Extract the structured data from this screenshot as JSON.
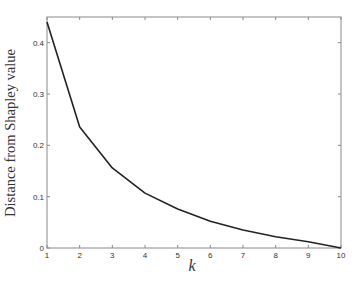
{
  "chart_data": {
    "type": "line",
    "title": "",
    "xlabel": "k",
    "ylabel": "Distance from Shapley value",
    "x": [
      1,
      2,
      3,
      4,
      5,
      6,
      7,
      8,
      9,
      10
    ],
    "series": [
      {
        "name": "distance",
        "values": [
          0.44,
          0.236,
          0.156,
          0.107,
          0.076,
          0.052,
          0.035,
          0.022,
          0.012,
          0.0
        ],
        "color": "#222222"
      }
    ],
    "xlim": [
      1,
      10
    ],
    "ylim": [
      0,
      0.45
    ],
    "xticks": [
      "1",
      "2",
      "3",
      "4",
      "5",
      "6",
      "7",
      "8",
      "9",
      "10"
    ],
    "yticks": [
      "0",
      "0.1",
      "0.2",
      "0.3",
      "0.4"
    ],
    "grid": false,
    "legend": null
  },
  "colors": {
    "axis": "#8a8a8a",
    "line": "#222222",
    "text": "#333333"
  }
}
